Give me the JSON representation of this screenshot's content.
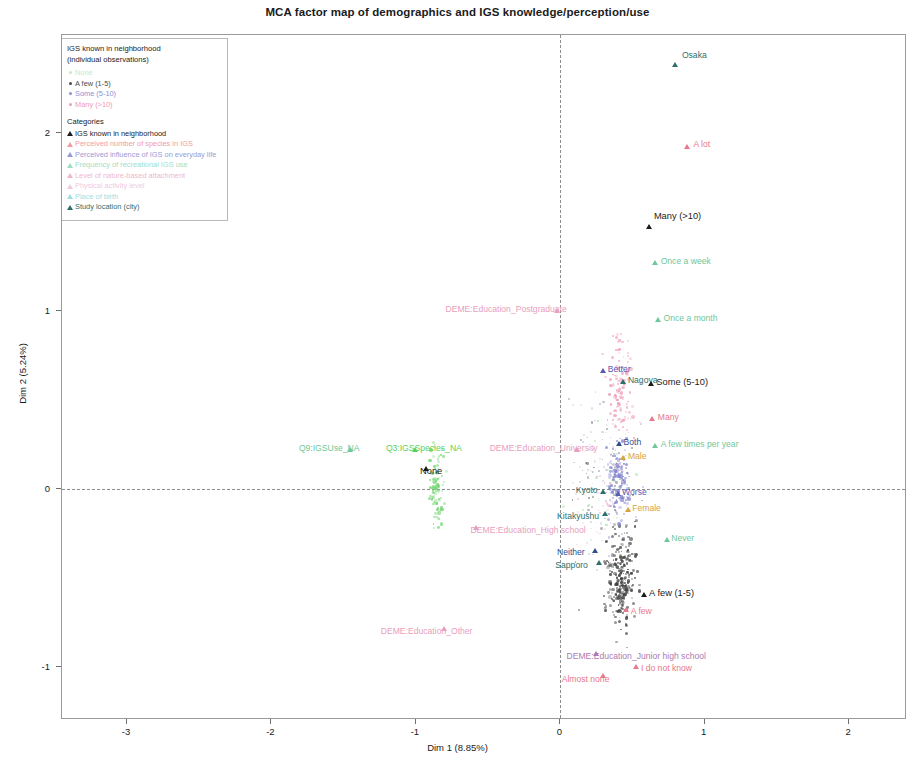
{
  "title": "MCA factor map of demographics and IGS knowledge/perception/use",
  "axes": {
    "x_label": "Dim 1 (8.85%)",
    "y_label": "Dim 2 (5.24%)",
    "x_ticks": [
      "-3",
      "-2",
      "-1",
      "0",
      "1",
      "2"
    ],
    "y_ticks": [
      "-1",
      "0",
      "1",
      "2"
    ]
  },
  "legend": {
    "title": "IGS known in neighborhood",
    "subtitle": "(individual observations)",
    "individual_items": [
      {
        "label": "None",
        "color": "#c8e8c8"
      },
      {
        "label": "A few (1-5)",
        "color": "#4a4a4a"
      },
      {
        "label": "Some (5-10)",
        "color": "#8d8fd4"
      },
      {
        "label": "Many (>10)",
        "color": "#ef9ab5"
      }
    ],
    "categories_header": "Categories",
    "category_items": [
      {
        "label": "IGS known in neighborhood",
        "color": "#1b1b1b"
      },
      {
        "label": "Perceived number of species in IGS",
        "color": "#f29aa6"
      },
      {
        "label": "Perceived influence of IGS on everyday life",
        "color": "#9a9ad8"
      },
      {
        "label": "Frequency of recreational IGS use",
        "color": "#9fdcc4"
      },
      {
        "label": "Level of nature-based attachment",
        "color": "#f0b6cc"
      },
      {
        "label": "Physical activity level",
        "color": "#f2c9de"
      },
      {
        "label": "Place of birth",
        "color": "#9ee0e0"
      },
      {
        "label": "Study location (city)",
        "color": "#2f6f6a"
      }
    ]
  },
  "chart_data": {
    "type": "scatter",
    "title": "MCA factor map of demographics and IGS knowledge/perception/use",
    "xlabel": "Dim 1 (8.85%)",
    "ylabel": "Dim 2 (5.24%)",
    "xlim": [
      -3.45,
      2.4
    ],
    "ylim": [
      -1.3,
      2.55
    ],
    "grid": false,
    "legend_position": "top-left",
    "category_points": [
      {
        "label": "Osaka",
        "x": 0.8,
        "y": 2.38,
        "color": "#2f6f6a",
        "group": "Study location (city)",
        "label_dx": 6,
        "label_dy": -9
      },
      {
        "label": "A lot",
        "x": 0.88,
        "y": 1.92,
        "color": "#e8788c",
        "group": "Level of nature-based attachment",
        "label_dx": 6,
        "label_dy": -2
      },
      {
        "label": "Many (>10)",
        "x": 0.62,
        "y": 1.47,
        "color": "#1b1b1b",
        "group": "IGS known in neighborhood",
        "label_dx": 4,
        "label_dy": -10
      },
      {
        "label": "Once a week",
        "x": 0.66,
        "y": 1.27,
        "color": "#6fc79a",
        "group": "Frequency of recreational IGS use",
        "label_dx": 5,
        "label_dy": -1
      },
      {
        "label": "Once a month",
        "x": 0.68,
        "y": 0.95,
        "color": "#6fc79a",
        "group": "Frequency of recreational IGS use",
        "label_dx": 5,
        "label_dy": -1
      },
      {
        "label": "DEME:Education_Postgraduate",
        "x": -0.02,
        "y": 1.0,
        "color": "#e8a0bd",
        "group": "Education",
        "label_dx": -112,
        "label_dy": -1
      },
      {
        "label": "Better",
        "x": 0.3,
        "y": 0.66,
        "color": "#5a5ab0",
        "group": "Perceived influence of IGS on everyday life",
        "label_dx": 4,
        "label_dy": -1
      },
      {
        "label": "Nagoya",
        "x": 0.44,
        "y": 0.6,
        "color": "#2f6f6a",
        "group": "Study location (city)",
        "label_dx": 4,
        "label_dy": -1
      },
      {
        "label": "Some (5-10)",
        "x": 0.63,
        "y": 0.59,
        "color": "#1b1b1b",
        "group": "IGS known in neighborhood",
        "label_dx": 5,
        "label_dy": -1
      },
      {
        "label": "Many",
        "x": 0.64,
        "y": 0.39,
        "color": "#e8788c",
        "group": "Perceived number of species in IGS",
        "label_dx": 5,
        "label_dy": -1
      },
      {
        "label": "Both",
        "x": 0.41,
        "y": 0.25,
        "color": "#2f4f8f",
        "group": "Place of birth",
        "label_dx": 4,
        "label_dy": -1
      },
      {
        "label": "A few times per year",
        "x": 0.66,
        "y": 0.24,
        "color": "#6fc79a",
        "group": "Frequency of recreational IGS use",
        "label_dx": 5,
        "label_dy": -1
      },
      {
        "label": "DEME:Education_University",
        "x": 0.12,
        "y": 0.22,
        "color": "#e8a0bd",
        "group": "Education",
        "label_dx": -88,
        "label_dy": -1
      },
      {
        "label": "Q9:IGSUse_NA",
        "x": -1.45,
        "y": 0.22,
        "color": "#6fc79a",
        "group": "Frequency of recreational IGS use",
        "label_dx": -52,
        "label_dy": -1
      },
      {
        "label": "Q3:IGSSpecies_NA",
        "x": -1.0,
        "y": 0.22,
        "color": "#5ad25a",
        "group": "Perceived number of species in IGS",
        "label_dx": -30,
        "label_dy": -1
      },
      {
        "label": "None",
        "x": -0.93,
        "y": 0.11,
        "color": "#1b1b1b",
        "group": "IGS known in neighborhood",
        "label_dx": -6,
        "label_dy": 3
      },
      {
        "label": "Male",
        "x": 0.44,
        "y": 0.17,
        "color": "#d8a43c",
        "group": "Gender",
        "label_dx": 4,
        "label_dy": -1
      },
      {
        "label": "Kyoto",
        "x": 0.3,
        "y": -0.02,
        "color": "#2f6f6a",
        "group": "Study location (city)",
        "label_dx": -28,
        "label_dy": -1
      },
      {
        "label": "Worse",
        "x": 0.4,
        "y": -0.03,
        "color": "#5a5ab0",
        "group": "Perceived influence of IGS on everyday life",
        "label_dx": 4,
        "label_dy": -1
      },
      {
        "label": "Female",
        "x": 0.47,
        "y": -0.12,
        "color": "#d8a43c",
        "group": "Gender",
        "label_dx": 4,
        "label_dy": -1
      },
      {
        "label": "Kitakyushu",
        "x": 0.31,
        "y": -0.14,
        "color": "#2f6f6a",
        "group": "Study location (city)",
        "label_dx": -48,
        "label_dy": 3
      },
      {
        "label": "DEME:Education_High school",
        "x": -0.58,
        "y": -0.22,
        "color": "#e8a0bd",
        "group": "Education",
        "label_dx": -6,
        "label_dy": 3
      },
      {
        "label": "Neither",
        "x": 0.24,
        "y": -0.35,
        "color": "#2f4f8f",
        "group": "Place of birth",
        "label_dx": -38,
        "label_dy": 2
      },
      {
        "label": "Sapporo",
        "x": 0.27,
        "y": -0.42,
        "color": "#2f6f6a",
        "group": "Study location (city)",
        "label_dx": -44,
        "label_dy": 3
      },
      {
        "label": "Never",
        "x": 0.74,
        "y": -0.29,
        "color": "#6fc79a",
        "group": "Frequency of recreational IGS use",
        "label_dx": 4,
        "label_dy": 0
      },
      {
        "label": "A few (1-5)",
        "x": 0.58,
        "y": -0.6,
        "color": "#1b1b1b",
        "group": "IGS known in neighborhood",
        "label_dx": 5,
        "label_dy": 0
      },
      {
        "label": "A few",
        "x": 0.46,
        "y": -0.68,
        "color": "#e8788c",
        "group": "Perceived number of species in IGS",
        "label_dx": 4,
        "label_dy": 2
      },
      {
        "label": "DEME:Education_Other",
        "x": -0.8,
        "y": -0.79,
        "color": "#e8a0bd",
        "group": "Education",
        "label_dx": -64,
        "label_dy": 3
      },
      {
        "label": "DEME:Education_Junior high school",
        "x": 0.25,
        "y": -0.93,
        "color": "#b07ab0",
        "group": "Education",
        "label_dx": -30,
        "label_dy": 3
      },
      {
        "label": "I do not know",
        "x": 0.53,
        "y": -1.0,
        "color": "#e8788c",
        "group": "Perceived number of species in IGS",
        "label_dx": 4,
        "label_dy": 2
      },
      {
        "label": "Almost none",
        "x": 0.3,
        "y": -1.05,
        "color": "#e8788c",
        "group": "Perceived number of species in IGS",
        "label_dx": -42,
        "label_dy": 4
      }
    ],
    "individual_clusters": [
      {
        "group": "A few (1-5)",
        "color": "#3b3b3b",
        "n": 260,
        "cx": 0.42,
        "cy": -0.5,
        "sx": 0.11,
        "sy": 0.3
      },
      {
        "group": "Some (5-10)",
        "color": "#8182cc",
        "n": 150,
        "cx": 0.4,
        "cy": 0.05,
        "sx": 0.09,
        "sy": 0.22
      },
      {
        "group": "Many (>10)",
        "color": "#ef9ab5",
        "n": 110,
        "cx": 0.42,
        "cy": 0.55,
        "sx": 0.1,
        "sy": 0.32
      },
      {
        "group": "None",
        "color": "#6cd46c",
        "n": 90,
        "cx": -0.86,
        "cy": 0.02,
        "sx": 0.06,
        "sy": 0.22
      }
    ]
  }
}
